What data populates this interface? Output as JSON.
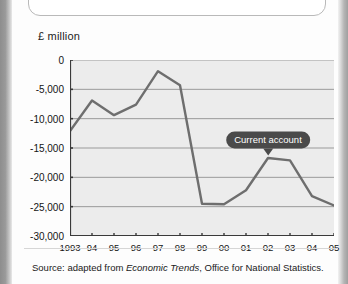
{
  "figure": {
    "y_axis_title": "£ million",
    "source_prefix": "Source: adapted from ",
    "source_italic": "Economic Trends",
    "source_suffix": ", Office for National Statistics."
  },
  "colors": {
    "line": "#6e6e6e",
    "plot_background": "#ececec",
    "gridline": "#9a9a9a",
    "axis": "#3a3a3a",
    "callout_background": "#4a4a4a",
    "callout_text": "#ffffff"
  },
  "chart_data": {
    "type": "line",
    "title": "",
    "xlabel": "",
    "ylabel": "£ million",
    "categories": [
      "1993",
      "94",
      "95",
      "96",
      "97",
      "98",
      "99",
      "00",
      "01",
      "02",
      "03",
      "04",
      "05"
    ],
    "x": [
      1993,
      1994,
      1995,
      1996,
      1997,
      1998,
      1999,
      2000,
      2001,
      2002,
      2003,
      2004,
      2005
    ],
    "tick_labels_y": [
      "0",
      "-5,000",
      "-10,000",
      "-15,000",
      "-20,000",
      "-25,000",
      "-30,000"
    ],
    "ylim": [
      -30000,
      0
    ],
    "ytick_values": [
      0,
      -5000,
      -10000,
      -15000,
      -20000,
      -25000,
      -30000
    ],
    "grid": true,
    "legend": "none",
    "series": [
      {
        "name": "Current account",
        "values": [
          -12100,
          -6900,
          -9400,
          -7600,
          -1900,
          -4300,
          -24500,
          -24600,
          -22200,
          -16700,
          -17100,
          -23200,
          -24800
        ]
      }
    ],
    "annotations": [
      {
        "text": "Current account",
        "at_x": 2002,
        "at_y": -16700
      }
    ]
  }
}
